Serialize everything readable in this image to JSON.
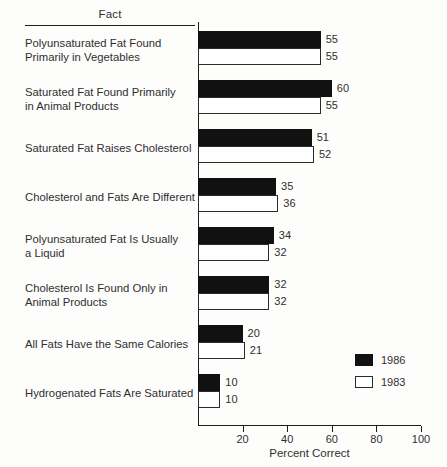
{
  "chart_data": {
    "type": "bar",
    "orientation": "horizontal",
    "title": "",
    "xlabel": "Percent Correct",
    "ylabel": "Fact",
    "column_header": "Fact",
    "xlim": [
      0,
      100
    ],
    "xticks": [
      20,
      40,
      60,
      80,
      100
    ],
    "xticklabels": [
      "20",
      "40",
      "60",
      "80",
      "100"
    ],
    "grid": false,
    "legend_position": "lower-right",
    "categories": [
      "Polyunsaturated Fat Found\nPrimarily in Vegetables",
      "Saturated Fat Found Primarily\nin Animal Products",
      "Saturated Fat Raises Cholesterol",
      "Cholesterol and Fats Are Different",
      "Polyunsaturated Fat Is Usually\na Liquid",
      "Cholesterol Is Found Only in\nAnimal Products",
      "All Fats Have the Same Calories",
      "Hydrogenated Fats Are Saturated"
    ],
    "series": [
      {
        "name": "1986",
        "color": "#111111",
        "values": [
          55,
          60,
          51,
          35,
          34,
          32,
          20,
          10
        ]
      },
      {
        "name": "1983",
        "color": "#ffffff",
        "values": [
          55,
          55,
          52,
          36,
          32,
          32,
          21,
          10
        ]
      }
    ]
  },
  "legend": {
    "entries": [
      {
        "label": "1986"
      },
      {
        "label": "1983"
      }
    ]
  }
}
